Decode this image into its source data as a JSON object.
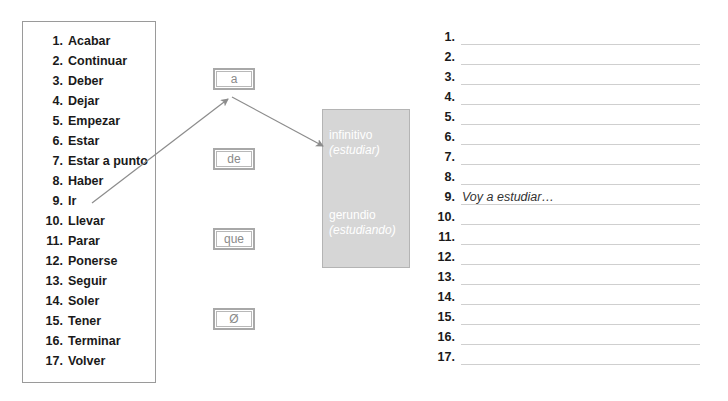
{
  "verbs": {
    "items": [
      {
        "num": "1.",
        "label": "Acabar"
      },
      {
        "num": "2.",
        "label": "Continuar"
      },
      {
        "num": "3.",
        "label": "Deber"
      },
      {
        "num": "4.",
        "label": "Dejar"
      },
      {
        "num": "5.",
        "label": "Empezar"
      },
      {
        "num": "6.",
        "label": "Estar"
      },
      {
        "num": "7.",
        "label": "Estar a punto"
      },
      {
        "num": "8.",
        "label": "Haber"
      },
      {
        "num": "9.",
        "label": "Ir"
      },
      {
        "num": "10.",
        "label": "Llevar"
      },
      {
        "num": "11.",
        "label": "Parar"
      },
      {
        "num": "12.",
        "label": "Ponerse"
      },
      {
        "num": "13.",
        "label": "Seguir"
      },
      {
        "num": "14.",
        "label": "Soler"
      },
      {
        "num": "15.",
        "label": "Tener"
      },
      {
        "num": "16.",
        "label": "Terminar"
      },
      {
        "num": "17.",
        "label": "Volver"
      }
    ]
  },
  "prepositions": {
    "items": [
      {
        "label": "a"
      },
      {
        "label": "de"
      },
      {
        "label": "que"
      },
      {
        "label": "Ø"
      }
    ]
  },
  "forms": {
    "infinitive": {
      "term": "infinitivo",
      "example": "(estudiar)"
    },
    "gerund": {
      "term": "gerundio",
      "example": "(estudiando)"
    }
  },
  "answers": {
    "items": [
      {
        "num": "1.",
        "text": ""
      },
      {
        "num": "2.",
        "text": ""
      },
      {
        "num": "3.",
        "text": ""
      },
      {
        "num": "4.",
        "text": ""
      },
      {
        "num": "5.",
        "text": ""
      },
      {
        "num": "6.",
        "text": ""
      },
      {
        "num": "7.",
        "text": ""
      },
      {
        "num": "8.",
        "text": ""
      },
      {
        "num": "9.",
        "text": "Voy a estudiar…"
      },
      {
        "num": "10.",
        "text": ""
      },
      {
        "num": "11.",
        "text": ""
      },
      {
        "num": "12.",
        "text": ""
      },
      {
        "num": "13.",
        "text": ""
      },
      {
        "num": "14.",
        "text": ""
      },
      {
        "num": "15.",
        "text": ""
      },
      {
        "num": "16.",
        "text": ""
      },
      {
        "num": "17.",
        "text": ""
      }
    ]
  },
  "colors": {
    "box_border": "#9a9a9a",
    "form_fill": "#d6d6d6",
    "arrow": "#8c8c8c",
    "answer_line": "#cfcfcf"
  }
}
